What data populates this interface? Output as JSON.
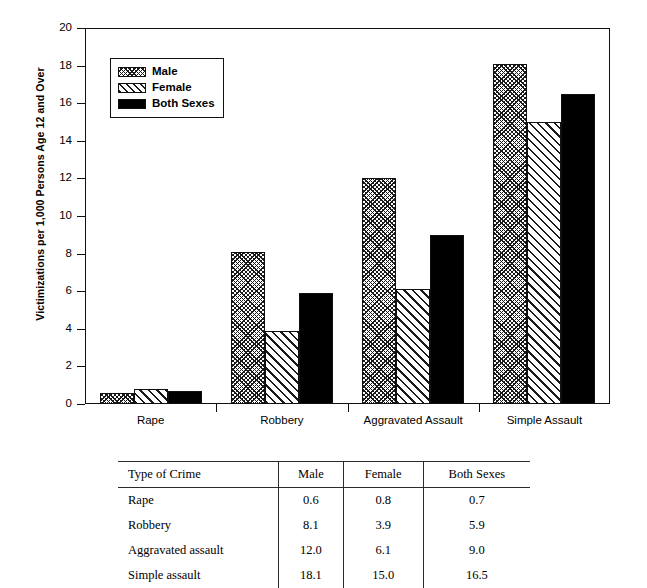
{
  "chart_data": {
    "type": "bar",
    "title": "",
    "xlabel": "",
    "ylabel": "Victimizations per 1,000 Persons Age 12 and Over",
    "ylim": [
      0,
      20
    ],
    "ytick_step": 2,
    "yminor_step": 0.5,
    "grid": false,
    "legend_position": "upper left",
    "categories": [
      "Rape",
      "Robbery",
      "Aggravated Assault",
      "Simple Assault"
    ],
    "series": [
      {
        "name": "Male",
        "values": [
          0.6,
          8.1,
          12.0,
          18.1
        ],
        "fill": "dense-crosshatch"
      },
      {
        "name": "Female",
        "values": [
          0.8,
          3.9,
          6.1,
          15.0
        ],
        "fill": "diagonal-hatch"
      },
      {
        "name": "Both Sexes",
        "values": [
          0.7,
          5.9,
          9.0,
          16.5
        ],
        "fill": "solid-black"
      }
    ],
    "ytick_labels": [
      "0",
      "2",
      "4",
      "6",
      "8",
      "10",
      "12",
      "14",
      "16",
      "18",
      "20"
    ]
  },
  "legend": {
    "items": [
      {
        "label": "Male"
      },
      {
        "label": "Female"
      },
      {
        "label": "Both Sexes"
      }
    ]
  },
  "table": {
    "headers": [
      "Type of Crime",
      "Male",
      "Female",
      "Both Sexes"
    ],
    "rows": [
      [
        "Rape",
        "0.6",
        "0.8",
        "0.7"
      ],
      [
        "Robbery",
        "8.1",
        "3.9",
        "5.9"
      ],
      [
        "Aggravated assault",
        "12.0",
        "6.1",
        "9.0"
      ],
      [
        "Simple assault",
        "18.1",
        "15.0",
        "16.5"
      ]
    ]
  }
}
